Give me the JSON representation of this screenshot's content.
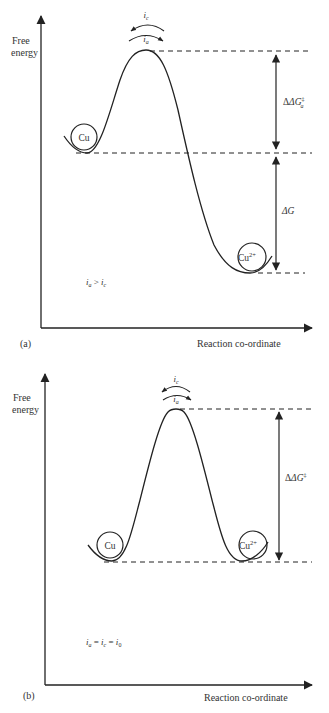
{
  "panel_a": {
    "label": "(a)",
    "y_axis_label_line1": "Free",
    "y_axis_label_line2": "energy",
    "x_axis_label": "Reaction co-ordinate",
    "left_species": "Cu",
    "right_species_base": "Cu",
    "right_species_sup": "2+",
    "top_current": "i",
    "top_current_sub": "c",
    "bottom_current": "i",
    "bottom_current_sub": "a",
    "barrier_label": "ΔG",
    "barrier_label_sup": "‡",
    "barrier_label_sub": "a",
    "delta_g_label": "ΔG",
    "condition_left": "i",
    "condition_left_sub": "a",
    "condition_op": " > ",
    "condition_right": "i",
    "condition_right_sub": "c"
  },
  "panel_b": {
    "label": "(b)",
    "y_axis_label_line1": "Free",
    "y_axis_label_line2": "energy",
    "x_axis_label": "Reaction co-ordinate",
    "left_species": "Cu",
    "right_species_base": "Cu",
    "right_species_sup": "2+",
    "top_current": "i",
    "top_current_sub": "c",
    "bottom_current": "i",
    "bottom_current_sub": "a",
    "barrier_label": "ΔG",
    "barrier_label_sup": "‡",
    "condition_a": "i",
    "condition_a_sub": "a",
    "condition_eq1": " = ",
    "condition_b": "i",
    "condition_b_sub": "c",
    "condition_eq2": " = ",
    "condition_c": "i",
    "condition_c_sub": "0"
  }
}
